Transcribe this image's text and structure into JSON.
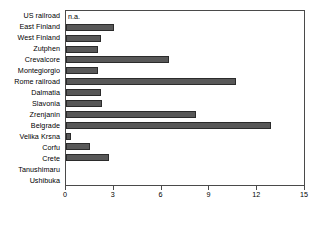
{
  "chart_data": {
    "type": "bar",
    "orientation": "horizontal",
    "title": "",
    "xlabel": "",
    "ylabel": "",
    "xlim": [
      0,
      15
    ],
    "xticks": [
      0,
      3,
      6,
      9,
      12,
      15
    ],
    "grid": false,
    "legend": null,
    "bar_color": "#585858",
    "bar_edge_color": "#2b2b2b",
    "axis_color": "#4a4a4a",
    "categories": [
      "US railroad",
      "East Finland",
      "West Finland",
      "Zutphen",
      "Crevalcore",
      "Montegiorgio",
      "Rome railroad",
      "Dalmatia",
      "Slavonia",
      "Zrenjanin",
      "Belgrade",
      "Velika Krsna",
      "Corfu",
      "Crete",
      "Tanushimaru",
      "Ushibuka"
    ],
    "values": [
      null,
      3.0,
      2.2,
      2.0,
      6.5,
      2.0,
      10.7,
      2.2,
      2.3,
      8.2,
      12.9,
      0.3,
      1.5,
      2.7,
      0,
      0
    ],
    "annotations": [
      {
        "category": "US railroad",
        "text": "n.a."
      }
    ]
  }
}
